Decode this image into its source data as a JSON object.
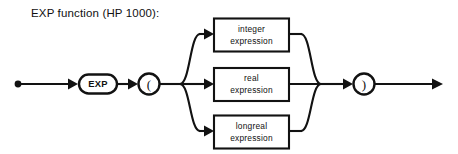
{
  "figure": {
    "caption": "EXP function (HP 1000):",
    "type": "railroad-syntax-diagram",
    "colors": {
      "background": "#ffffff",
      "ink": "#121212",
      "text": "#111111"
    }
  },
  "diagram": {
    "start_marker": "•",
    "end_marker": "arrow",
    "keyword_node": {
      "label": "EXP",
      "shape": "stadium"
    },
    "open_paren_node": {
      "label": "(",
      "shape": "circle"
    },
    "close_paren_node": {
      "label": ")",
      "shape": "circle"
    },
    "branches": [
      {
        "id": "integer-branch",
        "line1": "integer",
        "line2": "expression"
      },
      {
        "id": "real-branch",
        "line1": "real",
        "line2": "expression"
      },
      {
        "id": "longreal-branch",
        "line1": "longreal",
        "line2": "expression"
      }
    ]
  }
}
